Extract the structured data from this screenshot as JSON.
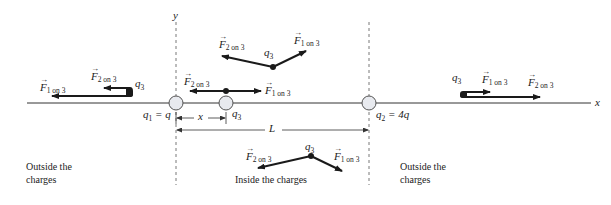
{
  "diagram": {
    "axes": {
      "x_label": "x",
      "y_label": "y"
    },
    "charges": {
      "q1": {
        "symbol": "q",
        "sub": "1",
        "value": "q",
        "label_text": "= q"
      },
      "q2": {
        "symbol": "q",
        "sub": "2",
        "value": "4q",
        "label_text": "= 4q"
      },
      "q3": {
        "symbol": "q",
        "sub": "3"
      }
    },
    "distances": {
      "x": "x",
      "L": "L"
    },
    "forces": {
      "f1": {
        "symbol": "F",
        "sub": "1 on 3"
      },
      "f2": {
        "symbol": "F",
        "sub": "2 on 3"
      }
    },
    "regions": {
      "left": {
        "line1": "Outside the",
        "line2": "charges"
      },
      "middle": {
        "text": "Inside the charges"
      },
      "right": {
        "line1": "Outside the",
        "line2": "charges"
      }
    },
    "colors": {
      "line": "#333333",
      "arrow": "#1a1a1a",
      "charge_fill": "#e8eaef",
      "dashed": "#555555"
    }
  }
}
